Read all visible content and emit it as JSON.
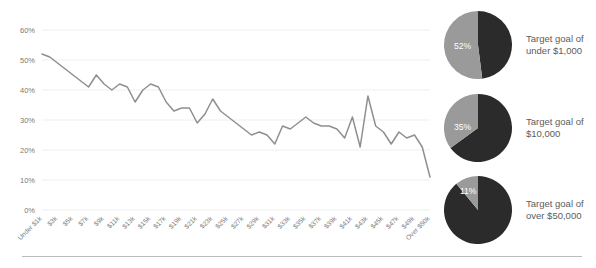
{
  "chart_data": [
    {
      "type": "line",
      "title": "",
      "xlabel": "",
      "ylabel": "",
      "ylim": [
        0,
        60
      ],
      "yticks": [
        0,
        10,
        20,
        30,
        40,
        50,
        60
      ],
      "ytick_labels": [
        "0%",
        "10%",
        "20%",
        "30%",
        "40%",
        "50%",
        "60%"
      ],
      "grid": true,
      "legend": "none",
      "line_color": "#8f8f8f",
      "categories": [
        "Under $1k",
        "$3k",
        "$5k",
        "$7k",
        "$9k",
        "$11k",
        "$13k",
        "$15k",
        "$17k",
        "$19k",
        "$21k",
        "$23k",
        "$25k",
        "$27k",
        "$29k",
        "$31k",
        "$33k",
        "$35k",
        "$37k",
        "$39k",
        "$41k",
        "$43k",
        "$45k",
        "$47k",
        "$49k",
        "Over $50k"
      ],
      "x": [
        "Under $1k",
        "$2k",
        "$3k",
        "$4k",
        "$5k",
        "$6k",
        "$7k",
        "$8k",
        "$9k",
        "$10k",
        "$11k",
        "$12k",
        "$13k",
        "$14k",
        "$15k",
        "$16k",
        "$17k",
        "$18k",
        "$19k",
        "$20k",
        "$21k",
        "$22k",
        "$23k",
        "$24k",
        "$25k",
        "$26k",
        "$27k",
        "$28k",
        "$29k",
        "$30k",
        "$31k",
        "$32k",
        "$33k",
        "$34k",
        "$35k",
        "$36k",
        "$37k",
        "$38k",
        "$39k",
        "$40k",
        "$41k",
        "$42k",
        "$43k",
        "$44k",
        "$45k",
        "$46k",
        "$47k",
        "$48k",
        "$49k",
        "$50k",
        "Over $50k"
      ],
      "values": [
        52,
        51,
        49,
        47,
        45,
        43,
        41,
        45,
        42,
        40,
        42,
        41,
        36,
        40,
        42,
        41,
        36,
        33,
        34,
        34,
        29,
        32,
        37,
        33,
        31,
        29,
        27,
        25,
        26,
        25,
        22,
        28,
        27,
        29,
        31,
        29,
        28,
        28,
        27,
        24,
        31,
        21,
        38,
        28,
        26,
        22,
        26,
        24,
        25,
        21,
        11
      ]
    },
    {
      "type": "pie",
      "title": "Target goal of under $1,000",
      "labels": [
        "Reached goal",
        "Did not reach goal"
      ],
      "values": [
        52,
        48
      ],
      "colors": [
        "#9a9a9a",
        "#2b2b2b"
      ],
      "highlight_label": "52%"
    },
    {
      "type": "pie",
      "title": "Target goal of $10,000",
      "labels": [
        "Reached goal",
        "Did not reach goal"
      ],
      "values": [
        35,
        65
      ],
      "colors": [
        "#9a9a9a",
        "#2b2b2b"
      ],
      "highlight_label": "35%"
    },
    {
      "type": "pie",
      "title": "Target goal of over $50,000",
      "labels": [
        "Reached goal",
        "Did not reach goal"
      ],
      "values": [
        11,
        89
      ],
      "colors": [
        "#9a9a9a",
        "#2b2b2b"
      ],
      "highlight_label": "11%"
    }
  ],
  "pies": [
    {
      "percent_label": "52%",
      "caption_line1": "Target goal of",
      "caption_line2": "under $1,000"
    },
    {
      "percent_label": "35%",
      "caption_line1": "Target goal of",
      "caption_line2": "$10,000"
    },
    {
      "percent_label": "11%",
      "caption_line1": "Target goal of",
      "caption_line2": "over $50,000"
    }
  ]
}
